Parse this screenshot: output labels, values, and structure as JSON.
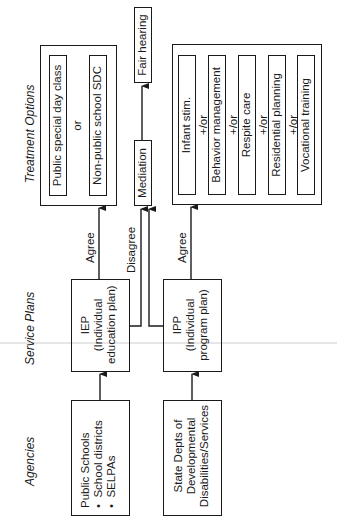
{
  "headings": {
    "agencies": "Agencies",
    "service_plans": "Service Plans",
    "treatment_options": "Treatment Options"
  },
  "agencies": {
    "public_schools": {
      "title": "Public Schools",
      "bullets": [
        "School districts",
        "SELPAs"
      ]
    },
    "state_depts": {
      "lines": [
        "State Depts of",
        "Developmental",
        "Disabilities/Services"
      ]
    }
  },
  "service_plans": {
    "iep": {
      "lines": [
        "IEP",
        "(Individual",
        "education plan)"
      ]
    },
    "ipp": {
      "lines": [
        "IPP",
        "(Individual",
        "program plan)"
      ]
    }
  },
  "arrow_labels": {
    "iep_agree": "Agree",
    "disagree": "Disagree",
    "ipp_agree": "Agree"
  },
  "dispute": {
    "mediation": "Mediation",
    "fair_hearing": "Fair hearing"
  },
  "treatment_school": {
    "options": [
      "Public special day class",
      "Non-public school SDC"
    ],
    "separator": "or"
  },
  "treatment_dds": {
    "options": [
      "Infant stim.",
      "Behavior management",
      "Respite care",
      "Residential planning",
      "Vocational training"
    ],
    "separator": "+/or"
  },
  "colors": {
    "ink": "#1a1a1a",
    "paper": "#ffffff"
  }
}
